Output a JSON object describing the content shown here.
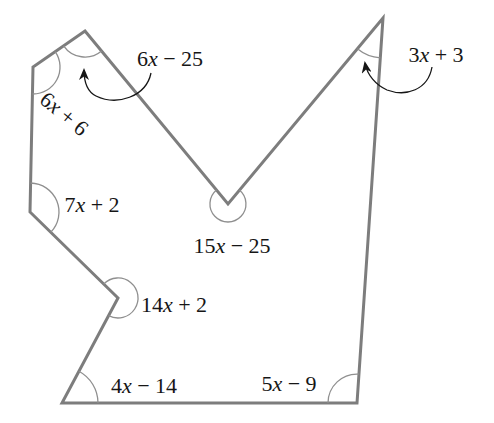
{
  "diagram": {
    "canvas": {
      "width": 494,
      "height": 423,
      "background": "#ffffff"
    },
    "style": {
      "edge_color": "#7d7d7d",
      "edge_width": 3,
      "arc_color": "#8f8f8f",
      "arc_width": 1.3,
      "arrow_color": "#161616",
      "arrow_width": 1.3,
      "text_color": "#161616"
    },
    "vertices": [
      {
        "name": "top-left-peak",
        "x": 85,
        "y": 31,
        "angle_expression": "6x − 25"
      },
      {
        "name": "notch-bottom",
        "x": 228,
        "y": 204,
        "angle_expression": "15x − 25"
      },
      {
        "name": "top-right-peak",
        "x": 383,
        "y": 18,
        "angle_expression": "3x + 3"
      },
      {
        "name": "bottom-right",
        "x": 357,
        "y": 403,
        "angle_expression": "5x − 9"
      },
      {
        "name": "bottom-left",
        "x": 62,
        "y": 403,
        "angle_expression": "4x − 14"
      },
      {
        "name": "left-reflex",
        "x": 118,
        "y": 298,
        "angle_expression": "14x + 2"
      },
      {
        "name": "left-mid",
        "x": 30,
        "y": 212,
        "angle_expression": "7x + 2"
      },
      {
        "name": "upper-left",
        "x": 33,
        "y": 67,
        "angle_expression": "6x + 6"
      }
    ],
    "angle_arcs": [
      {
        "name": "angle-arc-6x-25",
        "path": "M 63.6 45.8 A 26 26 0 0 0 101.6 51"
      },
      {
        "name": "angle-arc-15x-25",
        "path": "M 216.5 190.1 A 18 18 0 1 0 239.4 190.1"
      },
      {
        "name": "angle-arc-3x-3",
        "path": "M 357.4 48.8 A 40 40 0 0 0 380.3 57.9"
      },
      {
        "name": "angle-arc-5x-9",
        "path": "M 328 403 A 29 29 0 0 1 358.9 374.1"
      },
      {
        "name": "angle-arc-4x-14",
        "path": "M 78.9 371.3 A 36 36 0 0 1 98 403"
      },
      {
        "name": "angle-arc-14x-2",
        "path": "M 108.6 315.6 A 20 20 0 1 0 103.7 284"
      },
      {
        "name": "angle-arc-7x-2",
        "path": "M 30.6 183 A 29 29 0 0 1 50.7 232.3"
      },
      {
        "name": "angle-arc-6x-6",
        "path": "M 55.2 51.6 A 27 27 0 0 1 32.5 94"
      }
    ],
    "arrows": [
      {
        "name": "arrow-to-6x-25-angle",
        "path": "M 151 73 C 146 97, 117 106, 96 96 C 88 92, 84 82, 84 70"
      },
      {
        "name": "arrow-to-3x-3-angle",
        "path": "M 432 67 C 428 90, 406 97, 387 90 C 376 85, 367 75, 365 63"
      }
    ],
    "labels": [
      {
        "name": "angle-label-6x-25",
        "text": "6x − 25",
        "x": 170,
        "y": 66,
        "rotate": 0
      },
      {
        "name": "angle-label-3x-3",
        "text": "3x + 3",
        "x": 436,
        "y": 62,
        "rotate": 0
      },
      {
        "name": "angle-label-6x-6",
        "text": "6x + 6",
        "x": 64,
        "y": 121,
        "rotate": 40
      },
      {
        "name": "angle-label-7x-2",
        "text": "7x + 2",
        "x": 92,
        "y": 212,
        "rotate": 0
      },
      {
        "name": "angle-label-15x-25",
        "text": "15x − 25",
        "x": 232,
        "y": 253,
        "rotate": 0
      },
      {
        "name": "angle-label-14x-2",
        "text": "14x + 2",
        "x": 174,
        "y": 312,
        "rotate": 0
      },
      {
        "name": "angle-label-4x-14",
        "text": "4x − 14",
        "x": 144,
        "y": 393,
        "rotate": 0
      },
      {
        "name": "angle-label-5x-9",
        "text": "5x − 9",
        "x": 289,
        "y": 391,
        "rotate": 0
      }
    ]
  }
}
